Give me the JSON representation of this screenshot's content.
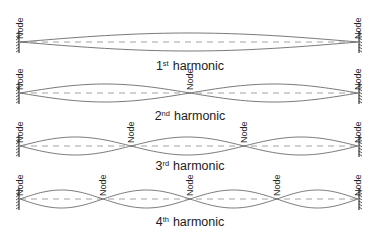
{
  "diagram": {
    "node_label": "Node",
    "x_start": 20,
    "x_end": 358,
    "amplitude": 9,
    "rows": [
      {
        "name": "1st harmonic",
        "number": "1",
        "suffix": "st",
        "word": "harmonic",
        "y": 42,
        "label_y": 70,
        "nodes": [
          20,
          358
        ]
      },
      {
        "name": "2nd harmonic",
        "number": "2",
        "suffix": "nd",
        "word": "harmonic",
        "y": 93,
        "label_y": 120,
        "nodes": [
          20,
          190,
          358
        ]
      },
      {
        "name": "3rd harmonic",
        "number": "3",
        "suffix": "rd",
        "word": "harmonic",
        "y": 146,
        "label_y": 170,
        "nodes": [
          20,
          131,
          244,
          358
        ]
      },
      {
        "name": "4th harmonic",
        "number": "4",
        "suffix": "th",
        "word": "harmonic",
        "y": 199,
        "label_y": 226,
        "nodes": [
          20,
          103,
          190,
          277,
          358
        ]
      }
    ]
  }
}
